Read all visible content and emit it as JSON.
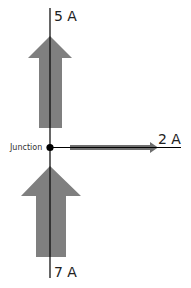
{
  "diagram": {
    "title": "",
    "junction": {
      "label": "Junction"
    },
    "currents": [
      {
        "id": "top",
        "label": "5 A",
        "direction": "up (leaving junction)",
        "value": 5
      },
      {
        "id": "bottom",
        "label": "7 A",
        "direction": "up (entering junction)",
        "value": 7
      },
      {
        "id": "right",
        "label": "2 A",
        "direction": "right (leaving junction)",
        "value": 2
      }
    ],
    "colors": {
      "arrow_fill": "#7f7f7f",
      "line": "#000000",
      "background": "#ffffff"
    }
  }
}
